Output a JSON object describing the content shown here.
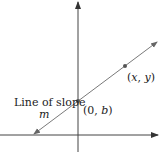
{
  "diagram": {
    "title": "",
    "labels": {
      "line_label": "Line of slope",
      "slope_var": "m",
      "intercept_point": "(0, b)",
      "intercept_open": "(0, ",
      "intercept_var": "b",
      "intercept_close": ")",
      "general_point_open": "(",
      "general_x": "x",
      "general_sep": ", ",
      "general_y": "y",
      "general_close": ")",
      "general_point": "(x, y)"
    },
    "colors": {
      "axis": "#444444",
      "line": "#7a7a7a",
      "point": "#555555",
      "text": "#222222"
    },
    "geometry": {
      "x_axis": {
        "x1": 0,
        "y1": 135,
        "x2": 158,
        "y2": 135
      },
      "y_axis": {
        "x1": 78,
        "y1": 150,
        "x2": 78,
        "y2": 2
      },
      "line": {
        "x1": 33,
        "y1": 135,
        "x2": 157,
        "y2": 42
      },
      "points": [
        {
          "name": "intercept",
          "cx": 78,
          "cy": 101
        },
        {
          "name": "general",
          "cx": 125,
          "cy": 66
        }
      ]
    }
  }
}
